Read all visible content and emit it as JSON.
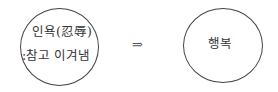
{
  "diagram": {
    "left_node": {
      "line1": "인욕(忍辱)",
      "line2": ":참고 이겨냄"
    },
    "arrow": "⇒",
    "right_node": {
      "label": "행복"
    }
  }
}
